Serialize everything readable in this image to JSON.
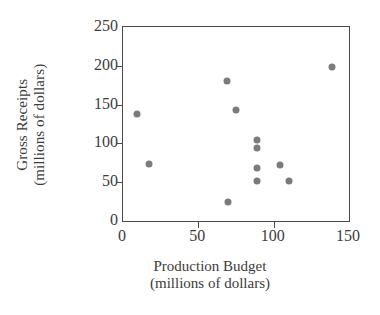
{
  "chart_data": {
    "type": "scatter",
    "title": "",
    "xlabel": "Production Budget (millions of dollars)",
    "ylabel": "Gross Receipts (millions of dollars)",
    "xlabel_lines": [
      "Production Budget",
      "(millions of dollars)"
    ],
    "ylabel_lines": [
      "Gross Receipts",
      "(millions of dollars)"
    ],
    "xlim": [
      0,
      150
    ],
    "ylim": [
      0,
      250
    ],
    "xticks": [
      0,
      50,
      100,
      150
    ],
    "yticks": [
      0,
      50,
      100,
      150,
      200,
      250
    ],
    "xtick_labels": [
      "0",
      "50",
      "100",
      "150"
    ],
    "ytick_labels": [
      "0",
      "50",
      "100",
      "150",
      "200",
      "250"
    ],
    "grid": false,
    "legend": false,
    "marker_color": "#7b7b7b",
    "axis_color": "#4a4a4a",
    "points": [
      {
        "x": 9,
        "y": 138
      },
      {
        "x": 17,
        "y": 74
      },
      {
        "x": 69,
        "y": 181
      },
      {
        "x": 70,
        "y": 24
      },
      {
        "x": 75,
        "y": 143
      },
      {
        "x": 89,
        "y": 104
      },
      {
        "x": 89,
        "y": 94
      },
      {
        "x": 89,
        "y": 68
      },
      {
        "x": 89,
        "y": 51
      },
      {
        "x": 104,
        "y": 72
      },
      {
        "x": 110,
        "y": 52
      },
      {
        "x": 139,
        "y": 199
      }
    ]
  }
}
